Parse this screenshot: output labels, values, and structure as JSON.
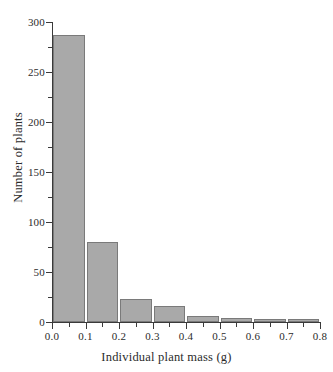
{
  "chart_data": {
    "type": "bar",
    "title": "",
    "subtitle": "",
    "xlabel": "Individual plant mass (g)",
    "ylabel": "Number of plants",
    "xlim": [
      0.0,
      0.8
    ],
    "ylim": [
      0,
      300
    ],
    "grid": false,
    "legend": null,
    "bin_width": 0.1,
    "categories": [
      "0.0-0.1",
      "0.1-0.2",
      "0.2-0.3",
      "0.3-0.4",
      "0.4-0.5",
      "0.5-0.6",
      "0.6-0.7",
      "0.7-0.8"
    ],
    "bin_starts": [
      0.0,
      0.1,
      0.2,
      0.3,
      0.4,
      0.5,
      0.6,
      0.7
    ],
    "values": [
      287,
      80,
      23,
      16,
      6,
      4,
      3,
      3
    ],
    "x_tick_labels": [
      "0.0",
      "0.1",
      "0.2",
      "0.3",
      "0.4",
      "0.5",
      "0.6",
      "0.7",
      "0.8"
    ],
    "x_tick_values": [
      0.0,
      0.1,
      0.2,
      0.3,
      0.4,
      0.5,
      0.6,
      0.7,
      0.8
    ],
    "x_minor_tick_values": [
      0.05,
      0.15,
      0.25,
      0.35,
      0.45,
      0.55,
      0.65,
      0.75
    ],
    "y_tick_labels": [
      "0",
      "50",
      "100",
      "150",
      "200",
      "250",
      "300"
    ],
    "y_tick_values": [
      0,
      50,
      100,
      150,
      200,
      250,
      300
    ],
    "y_minor_tick_values": [
      25,
      75,
      125,
      175,
      225,
      275
    ],
    "colors": {
      "bar_fill": "#a9a9a9",
      "bar_border": "#7a7a7a",
      "axis": "#3a3a3a",
      "text": "#2b2b2b",
      "background": "#ffffff"
    }
  }
}
